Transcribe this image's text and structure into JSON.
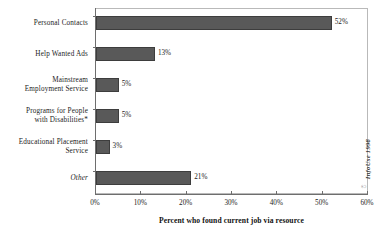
{
  "chart_data": {
    "type": "bar",
    "orientation": "horizontal",
    "title": "",
    "xlabel": "Percent who found current job via resource",
    "ylabel": "",
    "xlim": [
      0,
      60
    ],
    "xticks": [
      "0%",
      "10%",
      "20%",
      "30%",
      "40%",
      "50%",
      "60%"
    ],
    "xtick_values": [
      0,
      10,
      20,
      30,
      40,
      50,
      60
    ],
    "grid": false,
    "legend": "none",
    "categories": [
      "Personal Contacts",
      "Help Wanted Ads",
      "Mainstream Employment Service",
      "Programs for People with Disabilities*",
      "Educational Placement Service",
      "Other"
    ],
    "values": [
      52,
      13,
      5,
      5,
      3,
      21
    ],
    "data_labels": [
      "52%",
      "13%",
      "5%",
      "5%",
      "3%",
      "21%"
    ],
    "bar_color": "#595959",
    "bar_edge_color": "#3d3d3d",
    "axis_color": "#6e6e6e"
  },
  "categories": [
    {
      "label_line1": "Personal Contacts",
      "label_line2": "",
      "value": 52,
      "data_label": "52%",
      "italic": false
    },
    {
      "label_line1": "Help Wanted Ads",
      "label_line2": "",
      "value": 13,
      "data_label": "13%",
      "italic": false
    },
    {
      "label_line1": "Mainstream",
      "label_line2": "Employment Service",
      "value": 5,
      "data_label": "5%",
      "italic": false
    },
    {
      "label_line1": "Programs for People",
      "label_line2": "with Disabilities*",
      "value": 5,
      "data_label": "5%",
      "italic": false
    },
    {
      "label_line1": "Educational Placement",
      "label_line2": "Service",
      "value": 3,
      "data_label": "3%",
      "italic": false
    },
    {
      "label_line1": "Other",
      "label_line2": "",
      "value": 21,
      "data_label": "21%",
      "italic": true
    }
  ],
  "axis": {
    "title": "Percent who found current job via resource",
    "ticks": [
      "0%",
      "10%",
      "20%",
      "30%",
      "40%",
      "50%",
      "60%"
    ]
  },
  "credit": {
    "text": "InfoUse 1998",
    "mark": "©"
  }
}
